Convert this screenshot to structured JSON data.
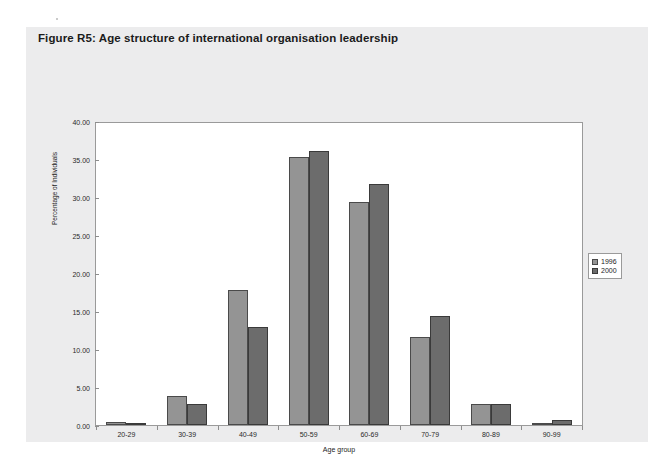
{
  "figure": {
    "title": "Figure R5: Age structure of international organisation leadership"
  },
  "chart_data": {
    "type": "bar",
    "title": "Figure R5: Age structure of international organisation leadership",
    "xlabel": "Age group",
    "ylabel": "Percentage of Individuals",
    "categories": [
      "20-29",
      "30-39",
      "40-49",
      "50-59",
      "60-69",
      "70-79",
      "80-89",
      "90-99"
    ],
    "series": [
      {
        "name": "1996",
        "color": "#949494",
        "values": [
          0.4,
          3.8,
          17.7,
          35.2,
          29.3,
          11.6,
          2.7,
          0.3
        ]
      },
      {
        "name": "2000",
        "color": "#6c6c6c",
        "values": [
          0.25,
          2.7,
          12.9,
          36.0,
          31.7,
          14.3,
          2.7,
          0.6
        ]
      }
    ],
    "ylim": [
      0,
      40
    ],
    "yticks": [
      "0.00",
      "5.00",
      "10.00",
      "15.00",
      "20.00",
      "25.00",
      "30.00",
      "35.00",
      "40.00"
    ],
    "ytick_values": [
      0,
      5,
      10,
      15,
      20,
      25,
      30,
      35,
      40
    ],
    "grid": false,
    "legend_position": "right"
  }
}
